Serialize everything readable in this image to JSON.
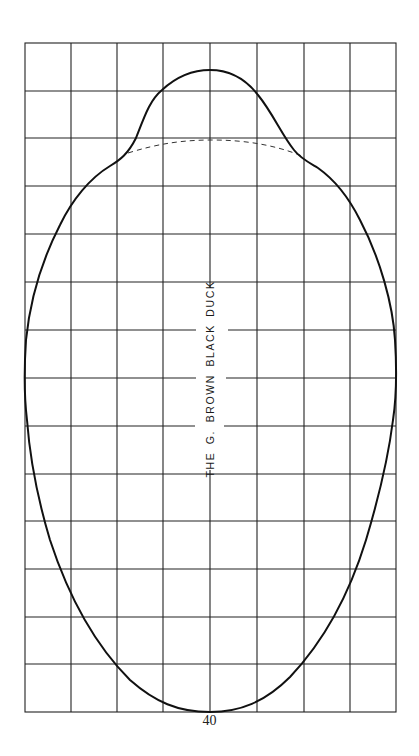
{
  "page": {
    "title": "THE G. BROWN BLACK DUCK",
    "page_number": "40"
  },
  "grid": {
    "columns": 8,
    "rows": 14,
    "left": 25,
    "right": 396,
    "top": 43,
    "bottom": 712,
    "line_color": "#222222"
  },
  "outline": {
    "solid_color": "#111111",
    "dashed_color": "#333333",
    "description": "Decoy body pattern outline with head bump at top; dashed line marks body line under head"
  }
}
